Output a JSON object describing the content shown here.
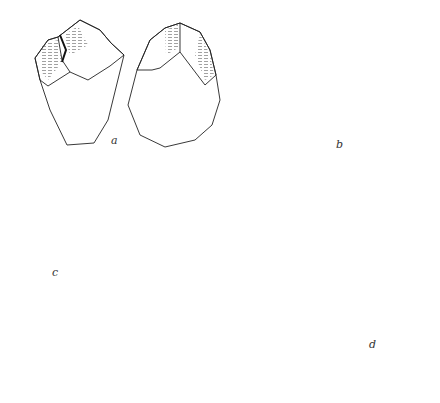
{
  "figure": {
    "labels": {
      "a": "a",
      "b": "b",
      "c": "c",
      "d": "d"
    },
    "items": [
      {
        "id": "a",
        "name": "flake tool, two views",
        "label": "a"
      },
      {
        "id": "b",
        "name": "notched flake, two views",
        "label": "b"
      },
      {
        "id": "c",
        "name": "prepared core, side and plan views",
        "label": "c"
      },
      {
        "id": "d",
        "name": "prismatic blade core with profile",
        "label": "d"
      }
    ],
    "arrows": [
      {
        "target": "c",
        "direction": "left"
      },
      {
        "target": "d",
        "direction": "down"
      }
    ],
    "colors": {
      "ink": "#222222",
      "background": "#ffffff"
    }
  }
}
